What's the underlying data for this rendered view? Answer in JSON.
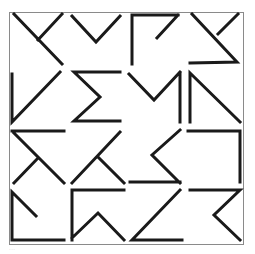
{
  "figure": {
    "frame": {
      "x": 9,
      "y": 12,
      "width": 234,
      "height": 232,
      "color": "#8a8a8a"
    },
    "stroke_color": "#1a1a1a",
    "stroke_width": 3,
    "grid": {
      "rows": 4,
      "cols": 4
    },
    "glyphs": [
      {
        "id": "r1c1",
        "row": 1,
        "col": 1,
        "shape": "crossed-diagonal",
        "d": "M14 14 L62 64 M62 14 L38 40"
      },
      {
        "id": "r1c2",
        "row": 1,
        "col": 2,
        "shape": "v-shape",
        "d": "M72 16 L96 42 L120 16"
      },
      {
        "id": "r1c3",
        "row": 1,
        "col": 3,
        "shape": "corner-with-slash",
        "d": "M132 64 L132 15 L178 15 M178 15 L157 38"
      },
      {
        "id": "r1c4",
        "row": 1,
        "col": 4,
        "shape": "diagonal-with-base",
        "d": "M192 14 L237 62 L190 63 M238 14 L218 34"
      },
      {
        "id": "r2c1",
        "row": 2,
        "col": 1,
        "shape": "check-angle",
        "d": "M12 74 L12 122 L60 72"
      },
      {
        "id": "r2c2",
        "row": 2,
        "col": 2,
        "shape": "sigma",
        "d": "M120 72 L74 72 L100 97 L74 121 L120 121"
      },
      {
        "id": "r2c3",
        "row": 2,
        "col": 3,
        "shape": "v-with-post",
        "d": "M129 74 L154 100 L180 72 M180 74 L180 122"
      },
      {
        "id": "r2c4",
        "row": 2,
        "col": 4,
        "shape": "post-with-diagonal",
        "d": "M190 122 L190 73 L240 122"
      },
      {
        "id": "r3c1",
        "row": 3,
        "col": 1,
        "shape": "bar-with-crossed-diagonal",
        "d": "M12 131 L64 131 M14 133 L64 183 M38 158 L14 183"
      },
      {
        "id": "r3c2",
        "row": 3,
        "col": 2,
        "shape": "lambda-cross",
        "d": "M72 183 L120 132 M98 157 L124 183"
      },
      {
        "id": "r3c3",
        "row": 3,
        "col": 3,
        "shape": "less-than-with-base",
        "d": "M180 130 L152 155 L180 183 M130 182 L180 182"
      },
      {
        "id": "r3c4",
        "row": 3,
        "col": 4,
        "shape": "reverse-l",
        "d": "M188 131 L240 131 L240 182"
      },
      {
        "id": "r4c1",
        "row": 4,
        "col": 1,
        "shape": "l-with-slash",
        "d": "M36 216 L12 192 L12 240 L64 240"
      },
      {
        "id": "r4c2",
        "row": 4,
        "col": 2,
        "shape": "corner-with-peak",
        "d": "M124 190 L72 190 L72 240 M72 238 L98 213 L124 240"
      },
      {
        "id": "r4c3",
        "row": 4,
        "col": 3,
        "shape": "diagonal-with-base",
        "d": "M180 190 L132 240 L182 240"
      },
      {
        "id": "r4c4",
        "row": 4,
        "col": 4,
        "shape": "bar-with-chevron",
        "d": "M190 190 L240 190 L214 215 L240 240"
      }
    ]
  },
  "caption": {
    "text": "···"
  }
}
